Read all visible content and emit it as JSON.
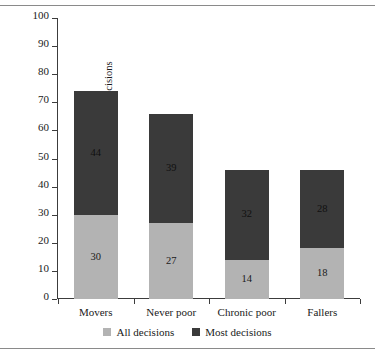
{
  "chart_data": {
    "type": "bar",
    "subtype": "stacked-bar",
    "title": "",
    "xlabel": "",
    "ylabel": "% households reporting control over decisions",
    "ylim": [
      0,
      100
    ],
    "yticks": [
      0,
      10,
      20,
      30,
      40,
      50,
      60,
      70,
      80,
      90,
      100
    ],
    "grid": false,
    "legend_position": "bottom",
    "categories": [
      "Movers",
      "Never poor",
      "Chronic poor",
      "Fallers"
    ],
    "series": [
      {
        "name": "All decisions",
        "color": "#b3b3b3",
        "values": [
          30,
          27,
          14,
          18
        ]
      },
      {
        "name": "Most decisions",
        "color": "#3a3a3a",
        "values": [
          44,
          39,
          32,
          28
        ]
      }
    ],
    "totals": [
      74,
      66,
      46,
      46
    ]
  },
  "legend": {
    "items": [
      {
        "label": "All decisions",
        "color": "#b3b3b3"
      },
      {
        "label": "Most decisions",
        "color": "#3a3a3a"
      }
    ]
  },
  "colors": {
    "axis": "#3c3c3c",
    "rule": "#8a8a8a",
    "text": "#1a1a1a",
    "background": "#ffffff"
  }
}
